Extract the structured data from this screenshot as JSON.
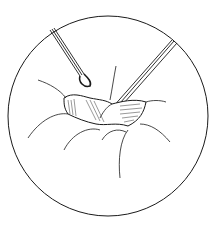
{
  "illustration": {
    "subject": "surgical-endoscopic-view",
    "elements": [
      "circular-field-of-view",
      "left-instrument",
      "right-instrument",
      "tissue-opening",
      "tissue-folds"
    ],
    "colors": {
      "line": "#1a1a1a",
      "background": "#ffffff",
      "shade": "#333333"
    }
  }
}
